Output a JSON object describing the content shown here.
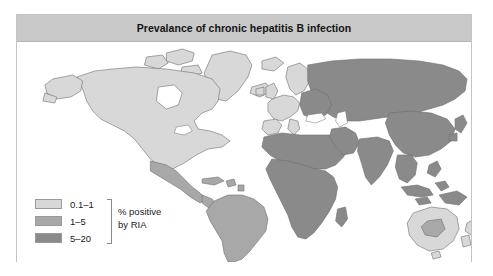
{
  "figure": {
    "title": "Prevalance of chronic hepatitis B infection",
    "panel_border_color": "#c4c4c4",
    "title_bar_color": "#c9c9c9",
    "background_color": "#ffffff"
  },
  "legend": {
    "caption_line1": "% positive",
    "caption_line2": "by RIA",
    "items": [
      {
        "label": "0.1–1",
        "color": "#d8d8d8",
        "name": "legend-swatch-low"
      },
      {
        "label": "1–5",
        "color": "#a8a8a8",
        "name": "legend-swatch-mid"
      },
      {
        "label": "5–20",
        "color": "#8a8a8a",
        "name": "legend-swatch-high"
      }
    ]
  },
  "map": {
    "outline_color": "#6f6f6f",
    "ocean_color": "#ffffff",
    "categories": {
      "low": "0.1–1",
      "mid": "1–5",
      "high": "5–20"
    },
    "regions": [
      {
        "name": "north-america",
        "category": "low"
      },
      {
        "name": "greenland",
        "category": "low"
      },
      {
        "name": "arctic-islands",
        "category": "low"
      },
      {
        "name": "mexico-central-america",
        "category": "mid"
      },
      {
        "name": "caribbean",
        "category": "mid"
      },
      {
        "name": "south-america",
        "category": "mid"
      },
      {
        "name": "western-europe",
        "category": "low"
      },
      {
        "name": "scandinavia",
        "category": "low"
      },
      {
        "name": "british-isles",
        "category": "low"
      },
      {
        "name": "eastern-europe-russia",
        "category": "high"
      },
      {
        "name": "north-africa-middle-east",
        "category": "high"
      },
      {
        "name": "sub-saharan-africa",
        "category": "high"
      },
      {
        "name": "madagascar",
        "category": "high"
      },
      {
        "name": "south-asia",
        "category": "high"
      },
      {
        "name": "east-asia-china",
        "category": "high"
      },
      {
        "name": "japan",
        "category": "high"
      },
      {
        "name": "southeast-asia",
        "category": "high"
      },
      {
        "name": "indonesia-philippines",
        "category": "high"
      },
      {
        "name": "new-guinea",
        "category": "high"
      },
      {
        "name": "australia",
        "category": "low"
      },
      {
        "name": "australia-interior",
        "category": "mid"
      },
      {
        "name": "new-zealand",
        "category": "low"
      }
    ]
  }
}
